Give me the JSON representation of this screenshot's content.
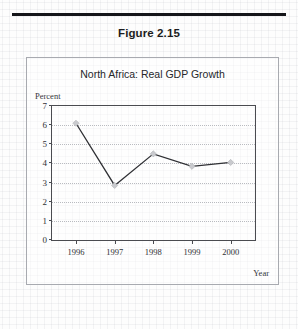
{
  "page": {
    "figure_label": "Figure 2.15"
  },
  "chart_data": {
    "type": "line",
    "title": "North Africa: Real GDP Growth",
    "xlabel": "Year",
    "ylabel": "Percent",
    "categories": [
      "1996",
      "1997",
      "1998",
      "1999",
      "2000"
    ],
    "values": [
      6.1,
      2.85,
      4.5,
      3.85,
      4.05
    ],
    "series": [
      {
        "name": "Real GDP Growth",
        "values": [
          6.1,
          2.85,
          4.5,
          3.85,
          4.05
        ]
      }
    ],
    "ylim": [
      0,
      7
    ],
    "yticks": [
      0,
      1,
      2,
      3,
      4,
      5,
      6,
      7
    ],
    "ytick_labels": [
      "0",
      "1",
      "2",
      "3",
      "4",
      "5",
      "6",
      "7"
    ],
    "grid": "horizontal-dotted",
    "legend": "none",
    "line_color": "#2f3034",
    "marker_color": "#c9cace",
    "marker_shape": "diamond",
    "grid_color": "#b9bbc0",
    "axis_color": "#4a4b50"
  }
}
